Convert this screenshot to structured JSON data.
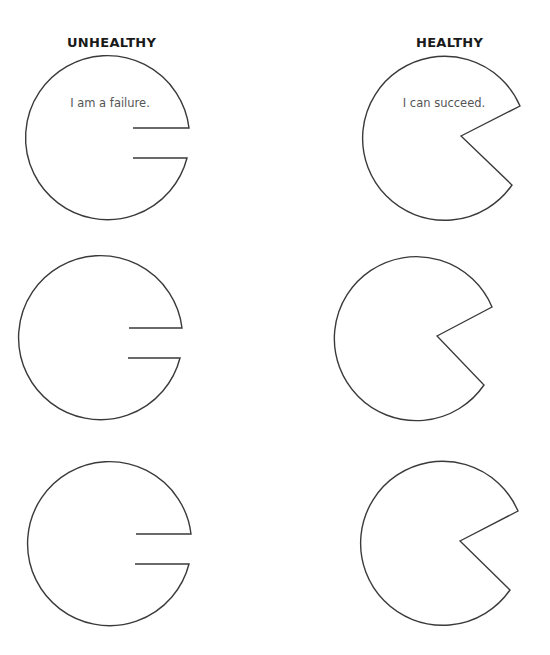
{
  "columns": {
    "unhealthy": {
      "heading": "UNHEALTHY",
      "caption": "I am a failure."
    },
    "healthy": {
      "heading": "HEALTHY",
      "caption": "I can succeed."
    }
  },
  "colors": {
    "stroke": "#3a3a3a",
    "heading": "#1a1a1a",
    "caption": "#555555",
    "background": "#ffffff"
  }
}
